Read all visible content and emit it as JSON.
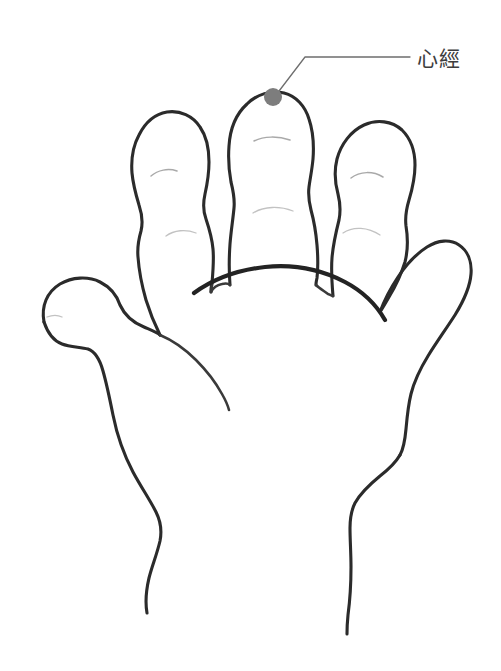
{
  "canvas": {
    "width": 501,
    "height": 671,
    "background_color": "#ffffff"
  },
  "diagram": {
    "stroke_color": "#2b2b2b",
    "crease_color": "#9a9a9a"
  },
  "annotation": {
    "label": "心經",
    "label_x": 417,
    "label_y": 49,
    "text_color": "#3d3d3d",
    "leader_color": "#6e6e6e",
    "point": {
      "name": "acupressure-point",
      "cx": 273,
      "cy": 97,
      "r": 9,
      "color": "#7d7d7d",
      "location": "middle-fingertip"
    }
  },
  "parts": [
    {
      "name": "thumb",
      "label": "thumb"
    },
    {
      "name": "index-finger",
      "label": "index finger"
    },
    {
      "name": "middle-finger",
      "label": "middle finger"
    },
    {
      "name": "ring-finger",
      "label": "ring finger"
    },
    {
      "name": "little-finger",
      "label": "little finger"
    },
    {
      "name": "palm",
      "label": "palm"
    },
    {
      "name": "wrist",
      "label": "wrist"
    }
  ]
}
